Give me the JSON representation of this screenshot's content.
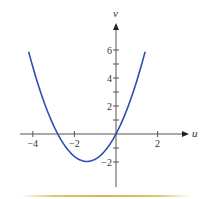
{
  "chart_data": {
    "type": "line",
    "title": "",
    "xlabel": "u",
    "ylabel": "v",
    "xlim": [
      -4.5,
      3.5
    ],
    "ylim": [
      -3.8,
      7.6
    ],
    "grid": false,
    "legend": null,
    "x_ticks": [
      -4,
      -2,
      2
    ],
    "x_tick_labels": [
      "−4",
      "−2",
      "2"
    ],
    "y_ticks": [
      -2,
      2,
      4,
      6
    ],
    "y_tick_labels": [
      "−2",
      "2",
      "4",
      "6"
    ],
    "y_minor_ticks": [
      -1,
      1,
      3,
      5
    ],
    "series": [
      {
        "name": "v = u^2 + 2.8u (parabola)",
        "color": "#2f4fb0",
        "x": [
          -4.2,
          -4.0,
          -3.5,
          -3.0,
          -2.8,
          -2.5,
          -2.0,
          -1.4,
          -1.0,
          -0.5,
          0.0,
          0.5,
          1.0,
          1.4
        ],
        "values": [
          5.88,
          4.8,
          2.45,
          0.6,
          0.0,
          -0.75,
          -1.6,
          -1.96,
          -1.8,
          -1.15,
          0.0,
          1.65,
          3.8,
          5.88
        ]
      }
    ],
    "annotations": {
      "roots": [
        -2.8,
        0
      ],
      "minimum": {
        "u": -1.4,
        "v": -1.96
      }
    }
  },
  "colors": {
    "curve": "#2f4fb0",
    "axis": "#555555",
    "rule": "#d9b456"
  }
}
